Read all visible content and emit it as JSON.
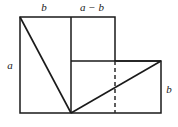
{
  "figure": {
    "kind": "geometric-dissection-diagram",
    "background_color": "#ffffff",
    "stroke_color": "#1a1a1a",
    "dashed_stroke_color": "#2b2b2b",
    "labels": {
      "top_left_segment": "b",
      "top_right_segment": "a − b",
      "left_side": "a",
      "right_side": "b"
    },
    "geometry": {
      "outer_top_left": [
        20,
        17
      ],
      "outer_top_right_upper": [
        115,
        17
      ],
      "mid_vertical_x": 71,
      "mid_horizontal_y": 61,
      "bottom_left": [
        20,
        113
      ],
      "bottom_vertex": [
        71,
        113
      ],
      "bottom_right": [
        161,
        113
      ],
      "right_upper": [
        161,
        61
      ],
      "dashed_vertical_x": 115,
      "diagonal_upper": [
        [
          20,
          17
        ],
        [
          71,
          113
        ]
      ],
      "diagonal_lower": [
        [
          71,
          113
        ],
        [
          161,
          61
        ]
      ]
    }
  }
}
